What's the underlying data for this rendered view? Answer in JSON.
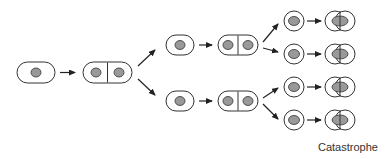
{
  "diagram": {
    "caption": "Catastrophe",
    "colors": {
      "outline": "#333333",
      "nucleus": "#999999",
      "arrow": "#222222",
      "background": "#ffffff"
    },
    "stages": [
      {
        "name": "single-cell",
        "count": 1
      },
      {
        "name": "dividing-cell",
        "count": 1
      },
      {
        "name": "daughter-cells",
        "count": 2
      },
      {
        "name": "granddaughter-cells",
        "count": 4
      },
      {
        "name": "catastrophe-cells",
        "count": 4
      }
    ]
  }
}
